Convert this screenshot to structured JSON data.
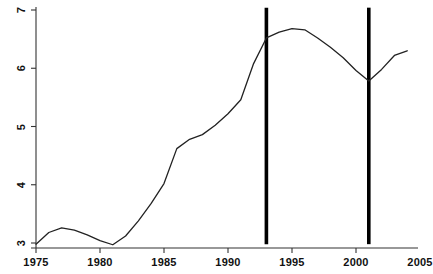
{
  "chart_data": {
    "type": "line",
    "title": "",
    "subtitle": "",
    "xlabel": "",
    "ylabel": "",
    "xlim": [
      1975,
      2005
    ],
    "ylim": [
      2.78,
      7.15
    ],
    "grid": false,
    "legend": "none",
    "xticks": [
      1975,
      1980,
      1985,
      1990,
      1995,
      2000,
      2005
    ],
    "xtick_labels": [
      "1975",
      "1980",
      "1985",
      "1990",
      "1995",
      "2000",
      "2005"
    ],
    "yticks": [
      3,
      4,
      5,
      6,
      7
    ],
    "ytick_labels": [
      "3",
      "4",
      "5",
      "6",
      "7"
    ],
    "ytick_label_rotation": -90,
    "series": [
      {
        "name": "series-1",
        "color": "#222222",
        "x": [
          1975,
          1976,
          1977,
          1978,
          1979,
          1980,
          1981,
          1982,
          1983,
          1984,
          1985,
          1986,
          1987,
          1988,
          1989,
          1990,
          1991,
          1992,
          1993,
          1994,
          1995,
          1996,
          1997,
          1998,
          1999,
          2000,
          2001,
          2002,
          2003,
          2004
        ],
        "values": [
          2.98,
          3.18,
          3.26,
          3.22,
          3.14,
          3.04,
          2.97,
          3.12,
          3.38,
          3.68,
          4.02,
          4.62,
          4.78,
          4.86,
          5.02,
          5.22,
          5.46,
          6.08,
          6.52,
          6.62,
          6.68,
          6.66,
          6.52,
          6.36,
          6.18,
          5.96,
          5.78,
          5.98,
          6.22,
          6.3
        ]
      }
    ],
    "vertical_markers": [
      {
        "name": "marker-1993",
        "x": 1993,
        "color": "#000000",
        "y_top": 7.04,
        "y_bottom": 2.98
      },
      {
        "name": "marker-2001",
        "x": 2001,
        "color": "#000000",
        "y_top": 7.04,
        "y_bottom": 2.98
      }
    ],
    "axes": {
      "x_axis_color": "#333333",
      "y_axis_color": "#333333"
    }
  }
}
